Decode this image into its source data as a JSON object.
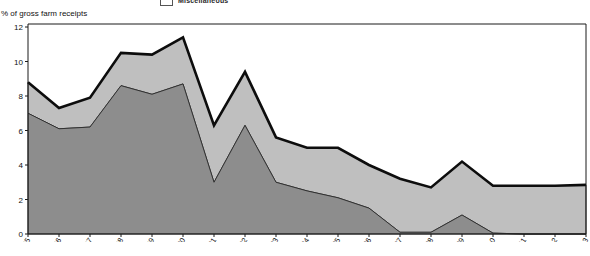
{
  "legend": {
    "items": [
      {
        "label": "Miscellaneous",
        "swatch_color": "#ffffff",
        "icon": "legend-swatch-icon"
      }
    ]
  },
  "axis_title": "% of gross farm receipts",
  "colors": {
    "band_top_total_line": "#0d0d0d",
    "band_middle": "#bfbfbf",
    "band_bottom": "#8d8d8d",
    "plot_background": "#ffffff",
    "axis": "#1a1a1a"
  },
  "chart_data": {
    "type": "area",
    "title": "",
    "subtitle": "",
    "xlabel": "",
    "ylabel": "% of gross farm receipts",
    "stacked": true,
    "grid": false,
    "legend_position": "top",
    "xlim": [
      1995,
      2013
    ],
    "ylim": [
      0,
      12
    ],
    "yticks": [
      0,
      2,
      4,
      6,
      8,
      10,
      12
    ],
    "ytick_labels": [
      "0",
      "2",
      "4",
      "6",
      "8",
      "10",
      "12"
    ],
    "categories": [
      "1995",
      "1996",
      "1997",
      "1998",
      "1999",
      "2000",
      "2001",
      "2002",
      "2003",
      "2004",
      "2005",
      "2006",
      "2007",
      "2008",
      "2009",
      "2010",
      "2011",
      "2012",
      "2013"
    ],
    "xtick_labels": [
      "1995",
      "1996",
      "1997",
      "1998",
      "1999",
      "2000",
      "2001",
      "2002",
      "2003",
      "2004",
      "2005",
      "2006",
      "2007",
      "2008",
      "2009",
      "2010",
      "2011",
      "2012",
      "2013"
    ],
    "series": [
      {
        "name": "bottom-band",
        "fill": "#8d8d8d",
        "values": [
          7.0,
          6.1,
          6.2,
          8.6,
          8.1,
          8.7,
          3.0,
          6.3,
          3.0,
          2.5,
          2.1,
          1.5,
          0.1,
          0.1,
          1.1,
          0.05,
          0.0,
          0.0,
          0.0
        ]
      },
      {
        "name": "middle-band",
        "fill": "#bfbfbf",
        "values": [
          1.0,
          1.1,
          1.6,
          1.9,
          2.2,
          2.6,
          3.2,
          3.0,
          2.6,
          2.4,
          2.8,
          2.4,
          3.0,
          2.6,
          3.1,
          2.7,
          2.8,
          2.8,
          2.85
        ]
      }
    ],
    "cumulative_total": {
      "name": "total-outline",
      "stroke": "#0d0d0d",
      "values": [
        8.8,
        7.3,
        7.9,
        10.5,
        10.4,
        11.4,
        6.3,
        9.4,
        5.6,
        5.0,
        5.0,
        4.0,
        3.2,
        2.7,
        4.2,
        2.8,
        2.8,
        2.8,
        2.85
      ]
    }
  }
}
